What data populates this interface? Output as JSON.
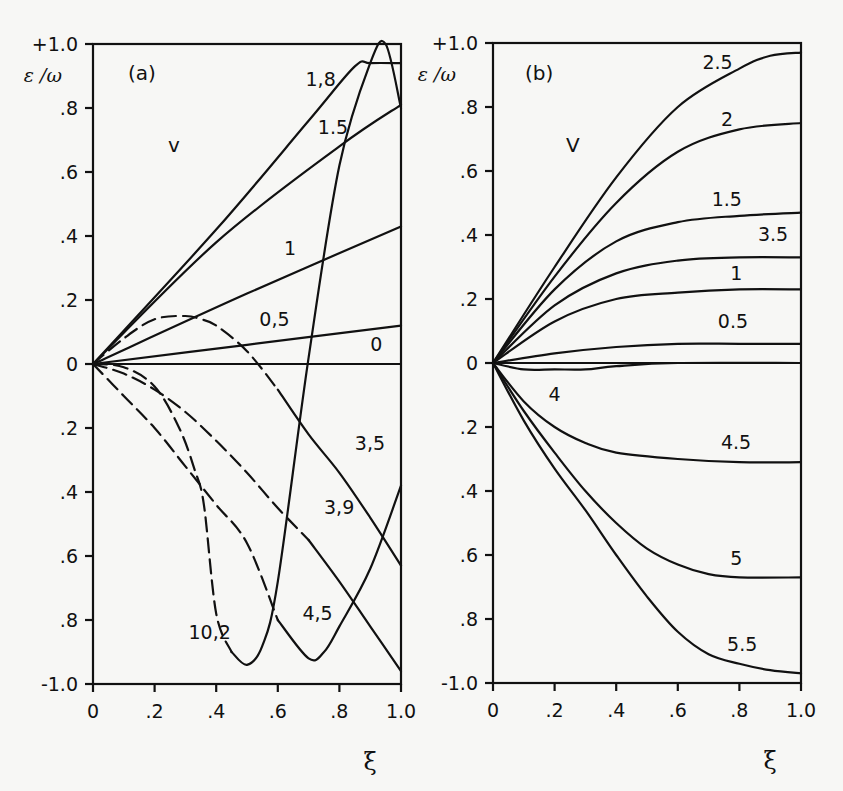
{
  "figure": {
    "panels": [
      "(a)",
      "(b)"
    ]
  },
  "chart_data": [
    {
      "type": "line",
      "panel_label": "(a)",
      "title": "",
      "xlabel": "ξ",
      "ylabel": "ε /ω",
      "xlim": [
        0,
        1.0
      ],
      "ylim": [
        -1.0,
        1.0
      ],
      "x_ticks": [
        "0",
        ".2",
        ".4",
        ".6",
        ".8",
        "1.0"
      ],
      "y_ticks": [
        "+1.0",
        ".8",
        ".6",
        ".4",
        ".2",
        "0",
        ".2",
        ".4",
        ".6",
        ".8",
        "-1.0"
      ],
      "parameter_label": "v",
      "grid": false,
      "series": [
        {
          "name": "0",
          "style": "solid",
          "x": [
            0,
            1.0
          ],
          "y": [
            0,
            0
          ]
        },
        {
          "name": "0,5",
          "style": "solid",
          "x": [
            0,
            0.5,
            1.0
          ],
          "y": [
            0,
            0.06,
            0.12
          ]
        },
        {
          "name": "1",
          "style": "solid",
          "x": [
            0,
            0.5,
            1.0
          ],
          "y": [
            0,
            0.22,
            0.43
          ]
        },
        {
          "name": "1.5",
          "style": "solid",
          "x": [
            0,
            0.4,
            0.8,
            1.0
          ],
          "y": [
            0,
            0.38,
            0.68,
            0.81
          ]
        },
        {
          "name": "1,8",
          "style": "solid",
          "x": [
            0,
            0.4,
            0.7,
            0.85,
            0.9,
            1.0
          ],
          "y": [
            0,
            0.42,
            0.76,
            0.93,
            0.94,
            0.94
          ]
        },
        {
          "name": "10,2",
          "style": "dashed-then-solid",
          "x": [
            0,
            0.1,
            0.2,
            0.28,
            0.33,
            0.36,
            0.4,
            0.45,
            0.5,
            0.55,
            0.6,
            0.7,
            0.8,
            0.9,
            0.95,
            1.0
          ],
          "y": [
            0,
            -0.01,
            -0.07,
            -0.2,
            -0.33,
            -0.44,
            -0.78,
            -0.9,
            -0.94,
            -0.88,
            -0.68,
            0.02,
            0.62,
            0.94,
            1.0,
            0.8
          ]
        },
        {
          "name": "4,5",
          "style": "dashed-then-solid",
          "x": [
            0,
            0.1,
            0.2,
            0.3,
            0.4,
            0.5,
            0.6,
            0.7,
            0.75,
            0.8,
            0.9,
            1.0
          ],
          "y": [
            0,
            -0.1,
            -0.2,
            -0.32,
            -0.44,
            -0.56,
            -0.8,
            -0.92,
            -0.9,
            -0.82,
            -0.64,
            -0.38
          ]
        },
        {
          "name": "3,9",
          "style": "dashed-then-solid",
          "x": [
            0,
            0.1,
            0.2,
            0.3,
            0.4,
            0.5,
            0.6,
            0.7,
            0.8,
            0.9,
            1.0
          ],
          "y": [
            0,
            -0.03,
            -0.08,
            -0.15,
            -0.24,
            -0.34,
            -0.45,
            -0.55,
            -0.68,
            -0.82,
            -0.96
          ]
        },
        {
          "name": "3,5",
          "style": "dashed-then-solid",
          "x": [
            0,
            0.1,
            0.2,
            0.3,
            0.35,
            0.4,
            0.5,
            0.6,
            0.7,
            0.8,
            0.9,
            1.0
          ],
          "y": [
            0,
            0.08,
            0.14,
            0.15,
            0.14,
            0.12,
            0.04,
            -0.08,
            -0.22,
            -0.34,
            -0.48,
            -0.63
          ]
        }
      ],
      "labels": [
        {
          "text": "1,8",
          "x": 0.69,
          "y": 0.87
        },
        {
          "text": "1.5",
          "x": 0.73,
          "y": 0.72
        },
        {
          "text": "1",
          "x": 0.62,
          "y": 0.34
        },
        {
          "text": "0,5",
          "x": 0.54,
          "y": 0.12
        },
        {
          "text": "0",
          "x": 0.9,
          "y": 0.04
        },
        {
          "text": "3,5",
          "x": 0.85,
          "y": -0.27
        },
        {
          "text": "3,9",
          "x": 0.75,
          "y": -0.47
        },
        {
          "text": "4,5",
          "x": 0.68,
          "y": -0.8
        },
        {
          "text": "10,2",
          "x": 0.31,
          "y": -0.86
        }
      ]
    },
    {
      "type": "line",
      "panel_label": "(b)",
      "title": "",
      "xlabel": "ξ",
      "ylabel": "ε /ω",
      "xlim": [
        0,
        1.0
      ],
      "ylim": [
        -1.0,
        1.0
      ],
      "x_ticks": [
        "0",
        ".2",
        ".4",
        ".6",
        ".8",
        "1.0"
      ],
      "y_ticks": [
        "+1.0",
        ".8",
        ".6",
        ".4",
        ".2",
        "0",
        ".2",
        ".4",
        ".6",
        ".8",
        "-1.0"
      ],
      "parameter_label": "V",
      "grid": false,
      "series": [
        {
          "name": "2.5",
          "style": "solid",
          "x": [
            0,
            0.2,
            0.4,
            0.6,
            0.8,
            0.9,
            1.0
          ],
          "y": [
            0,
            0.3,
            0.58,
            0.8,
            0.92,
            0.96,
            0.97
          ]
        },
        {
          "name": "2",
          "style": "solid",
          "x": [
            0,
            0.2,
            0.4,
            0.6,
            0.8,
            1.0
          ],
          "y": [
            0,
            0.27,
            0.5,
            0.66,
            0.73,
            0.75
          ]
        },
        {
          "name": "1.5",
          "style": "solid",
          "x": [
            0,
            0.2,
            0.4,
            0.6,
            0.8,
            1.0
          ],
          "y": [
            0,
            0.23,
            0.38,
            0.44,
            0.46,
            0.47
          ]
        },
        {
          "name": "3.5",
          "style": "solid",
          "x": [
            0,
            0.2,
            0.4,
            0.6,
            0.8,
            1.0
          ],
          "y": [
            0,
            0.18,
            0.28,
            0.32,
            0.33,
            0.33
          ]
        },
        {
          "name": "1",
          "style": "solid",
          "x": [
            0,
            0.2,
            0.4,
            0.6,
            0.8,
            1.0
          ],
          "y": [
            0,
            0.13,
            0.2,
            0.22,
            0.23,
            0.23
          ]
        },
        {
          "name": "0.5",
          "style": "solid",
          "x": [
            0,
            0.2,
            0.4,
            0.6,
            0.8,
            1.0
          ],
          "y": [
            0,
            0.03,
            0.05,
            0.06,
            0.06,
            0.06
          ]
        },
        {
          "name": "4",
          "style": "solid",
          "x": [
            0,
            0.1,
            0.2,
            0.3,
            0.4,
            0.6,
            1.0
          ],
          "y": [
            0,
            -0.02,
            -0.02,
            -0.02,
            -0.01,
            0.0,
            0.0
          ]
        },
        {
          "name": "4.5",
          "style": "solid",
          "x": [
            0,
            0.1,
            0.2,
            0.3,
            0.4,
            0.6,
            0.8,
            1.0
          ],
          "y": [
            0,
            -0.12,
            -0.2,
            -0.25,
            -0.28,
            -0.3,
            -0.31,
            -0.31
          ]
        },
        {
          "name": "5",
          "style": "solid",
          "x": [
            0,
            0.1,
            0.2,
            0.3,
            0.4,
            0.5,
            0.6,
            0.7,
            0.8,
            1.0
          ],
          "y": [
            0,
            -0.15,
            -0.28,
            -0.4,
            -0.5,
            -0.58,
            -0.63,
            -0.66,
            -0.67,
            -0.67
          ]
        },
        {
          "name": "5.5",
          "style": "solid",
          "x": [
            0,
            0.1,
            0.2,
            0.3,
            0.4,
            0.5,
            0.6,
            0.7,
            0.8,
            0.9,
            1.0
          ],
          "y": [
            0,
            -0.18,
            -0.33,
            -0.46,
            -0.6,
            -0.73,
            -0.84,
            -0.91,
            -0.94,
            -0.96,
            -0.97
          ]
        }
      ],
      "labels": [
        {
          "text": "2.5",
          "x": 0.68,
          "y": 0.92
        },
        {
          "text": "2",
          "x": 0.74,
          "y": 0.74
        },
        {
          "text": "1.5",
          "x": 0.71,
          "y": 0.49
        },
        {
          "text": "3.5",
          "x": 0.86,
          "y": 0.38
        },
        {
          "text": "1",
          "x": 0.77,
          "y": 0.26
        },
        {
          "text": "0.5",
          "x": 0.73,
          "y": 0.11
        },
        {
          "text": "4",
          "x": 0.18,
          "y": -0.12
        },
        {
          "text": "4.5",
          "x": 0.74,
          "y": -0.27
        },
        {
          "text": "5",
          "x": 0.77,
          "y": -0.63
        },
        {
          "text": "5.5",
          "x": 0.76,
          "y": -0.9
        }
      ]
    }
  ]
}
